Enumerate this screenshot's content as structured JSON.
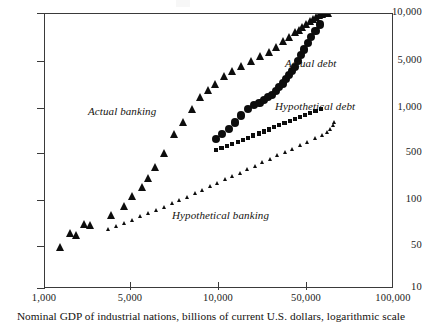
{
  "caption": "Nominal GDP of industrial nations, billions of current U.S. dollars, logarithmic scale",
  "axes": {
    "x_ticks": [
      "1,000",
      "5,000",
      "10,000",
      "50,000",
      "100,000"
    ],
    "y_ticks": [
      "10,000",
      "5,000",
      "1,000",
      "500",
      "100",
      "50",
      "10"
    ]
  },
  "annotations": {
    "actual_banking": "Actual banking",
    "actual_debt": "Actual debt",
    "hypothetical_debt": "Hypothetical debt",
    "hypothetical_banking": "Hypothetical banking"
  },
  "chart_data": {
    "type": "scatter",
    "title": "",
    "xlabel": "Nominal GDP of industrial nations, billions of current U.S. dollars, logarithmic scale",
    "ylabel": "",
    "xscale": "log",
    "yscale": "log",
    "xlim": [
      1000,
      100000
    ],
    "ylim": [
      10,
      10000
    ],
    "xticks": [
      1000,
      5000,
      10000,
      50000,
      100000
    ],
    "yticks": [
      10,
      50,
      100,
      500,
      1000,
      5000,
      10000
    ],
    "grid": false,
    "legend": "inline-annotations",
    "series": [
      {
        "name": "Actual banking",
        "marker": "triangle-large",
        "color": "#0d0d0d",
        "points": [
          [
            1250,
            28
          ],
          [
            1420,
            40
          ],
          [
            1530,
            38
          ],
          [
            1700,
            50
          ],
          [
            1850,
            49
          ],
          [
            2450,
            62
          ],
          [
            2900,
            78
          ],
          [
            3200,
            100
          ],
          [
            3650,
            128
          ],
          [
            3950,
            158
          ],
          [
            4350,
            210
          ],
          [
            4900,
            300
          ],
          [
            5600,
            480
          ],
          [
            6300,
            640
          ],
          [
            7100,
            900
          ],
          [
            7900,
            1200
          ],
          [
            8800,
            1450
          ],
          [
            9600,
            1700
          ],
          [
            10800,
            2050
          ],
          [
            12000,
            2350
          ],
          [
            13500,
            2650
          ],
          [
            15500,
            3000
          ],
          [
            17500,
            3400
          ],
          [
            19500,
            3800
          ],
          [
            21500,
            4300
          ],
          [
            23500,
            4900
          ],
          [
            25500,
            5500
          ],
          [
            27500,
            6200
          ],
          [
            29000,
            6600
          ],
          [
            30500,
            7000
          ],
          [
            32000,
            7600
          ],
          [
            33500,
            8200
          ],
          [
            35000,
            8700
          ],
          [
            36500,
            9100
          ],
          [
            38000,
            9500
          ],
          [
            39500,
            9800
          ],
          [
            41000,
            10000
          ],
          [
            42500,
            10000
          ]
        ]
      },
      {
        "name": "Actual debt",
        "marker": "circle-large",
        "color": "#0d0d0d",
        "points": [
          [
            9700,
            420
          ],
          [
            10500,
            480
          ],
          [
            11500,
            540
          ],
          [
            12500,
            640
          ],
          [
            13500,
            760
          ],
          [
            14700,
            900
          ],
          [
            16000,
            1000
          ],
          [
            17200,
            1050
          ],
          [
            18300,
            1120
          ],
          [
            19300,
            1200
          ],
          [
            20300,
            1280
          ],
          [
            21300,
            1400
          ],
          [
            22300,
            1550
          ],
          [
            23300,
            1700
          ],
          [
            24300,
            1900
          ],
          [
            25300,
            2100
          ],
          [
            26300,
            2350
          ],
          [
            27300,
            2600
          ],
          [
            28500,
            3000
          ],
          [
            29800,
            3500
          ],
          [
            31000,
            4000
          ],
          [
            32500,
            4700
          ],
          [
            34000,
            5500
          ],
          [
            36000,
            6400
          ],
          [
            38000,
            7500
          ]
        ]
      },
      {
        "name": "Hypothetical debt",
        "marker": "square-small",
        "color": "#0d0d0d",
        "points": [
          [
            9700,
            320
          ],
          [
            10400,
            338
          ],
          [
            11200,
            356
          ],
          [
            12000,
            375
          ],
          [
            12900,
            395
          ],
          [
            13800,
            415
          ],
          [
            14800,
            437
          ],
          [
            15800,
            460
          ],
          [
            17000,
            485
          ],
          [
            18200,
            510
          ],
          [
            19500,
            537
          ],
          [
            20900,
            565
          ],
          [
            22300,
            595
          ],
          [
            23900,
            626
          ],
          [
            25600,
            660
          ],
          [
            27400,
            694
          ],
          [
            29300,
            731
          ],
          [
            31400,
            770
          ],
          [
            33600,
            810
          ],
          [
            36000,
            853
          ],
          [
            38500,
            898
          ]
        ]
      },
      {
        "name": "Hypothetical banking",
        "marker": "triangle-small",
        "color": "#0d0d0d",
        "points": [
          [
            2350,
            44
          ],
          [
            2600,
            47
          ],
          [
            2900,
            51
          ],
          [
            3200,
            55
          ],
          [
            3550,
            60
          ],
          [
            3950,
            65
          ],
          [
            4400,
            71
          ],
          [
            4900,
            77
          ],
          [
            5450,
            84
          ],
          [
            6000,
            91
          ],
          [
            6650,
            99
          ],
          [
            7350,
            108
          ],
          [
            8100,
            118
          ],
          [
            8950,
            128
          ],
          [
            9900,
            140
          ],
          [
            10900,
            152
          ],
          [
            12000,
            166
          ],
          [
            13300,
            181
          ],
          [
            14700,
            197
          ],
          [
            16200,
            215
          ],
          [
            17900,
            234
          ],
          [
            19800,
            255
          ],
          [
            21800,
            278
          ],
          [
            24100,
            303
          ],
          [
            26600,
            330
          ],
          [
            29400,
            360
          ],
          [
            32500,
            392
          ],
          [
            35900,
            427
          ],
          [
            39600,
            465
          ],
          [
            42000,
            500
          ],
          [
            44000,
            540
          ],
          [
            45500,
            600
          ],
          [
            46500,
            650
          ]
        ]
      }
    ]
  }
}
